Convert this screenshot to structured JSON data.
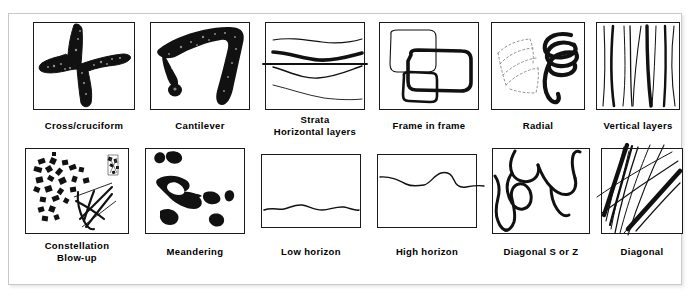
{
  "figure": {
    "type": "diagram-grid",
    "background_color": "#ffffff",
    "frame_color": "#c9c9c9",
    "ink_color": "#000000",
    "rows": 2,
    "columns": 6,
    "title": ""
  },
  "cells": [
    {
      "id": "cross-cruciform",
      "label": "Cross/cruciform",
      "label_lines": [
        "Cross/cruciform"
      ],
      "sketch": "thick-brush-cross-shape"
    },
    {
      "id": "cantilever",
      "label": "Cantilever",
      "label_lines": [
        "Cantilever"
      ],
      "sketch": "thick-brush-cantilever-arm"
    },
    {
      "id": "strata-horizontal-layers",
      "label": "Strata Horizontal layers",
      "label_lines": [
        "Strata",
        "Horizontal layers"
      ],
      "sketch": "stacked-horizontal-wavy-bands"
    },
    {
      "id": "frame-in-frame",
      "label": "Frame in frame",
      "label_lines": [
        "Frame in frame"
      ],
      "sketch": "nested-overlapping-rounded-rectangles"
    },
    {
      "id": "radial",
      "label": "Radial",
      "label_lines": [
        "Radial"
      ],
      "sketch": "radiating-coil-and-faint-fan"
    },
    {
      "id": "vertical-layers",
      "label": "Vertical layers",
      "label_lines": [
        "Vertical layers"
      ],
      "sketch": "near-vertical-strokes"
    },
    {
      "id": "constellation-blow-up",
      "label": "Constellation Blow-up",
      "label_lines": [
        "Constellation",
        "Blow-up"
      ],
      "sketch": "scattered-dots-cluster-with-blowup-lines"
    },
    {
      "id": "meandering",
      "label": "Meandering",
      "label_lines": [
        "Meandering"
      ],
      "sketch": "irregular-ink-blobs-trail"
    },
    {
      "id": "low-horizon",
      "label": "Low horizon",
      "label_lines": [
        "Low horizon"
      ],
      "sketch": "single-wavy-line-near-bottom"
    },
    {
      "id": "high-horizon",
      "label": "High horizon",
      "label_lines": [
        "High horizon"
      ],
      "sketch": "single-wavy-line-near-top"
    },
    {
      "id": "diagonal-s-or-z",
      "label": "Diagonal S or Z",
      "label_lines": [
        "Diagonal S or Z"
      ],
      "sketch": "serpentine-s-curves"
    },
    {
      "id": "diagonal",
      "label": "Diagonal",
      "label_lines": [
        "Diagonal"
      ],
      "sketch": "bundle-of-diagonal-strokes"
    }
  ]
}
